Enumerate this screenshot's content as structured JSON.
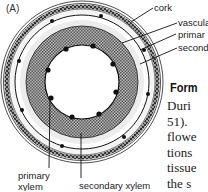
{
  "figure": {
    "panel_label": "(A)",
    "labels": {
      "cork": "cork",
      "vascular_cambium": "vascula",
      "primary_phloem": "primar",
      "secondary_phloem": "second",
      "primary_xylem_line1": "primary",
      "primary_xylem_line2": "xylem",
      "secondary_xylem": "secondary xylem"
    },
    "colors": {
      "ink": "#1a1a1a",
      "hatch_fill": "#9a9a9a",
      "pale_ring": "#ededed",
      "background": "#ffffff"
    }
  },
  "text_column": {
    "heading": "Form",
    "lines": [
      "Duri",
      "51).",
      "flowe",
      "tions",
      "tissue",
      "the s"
    ]
  }
}
